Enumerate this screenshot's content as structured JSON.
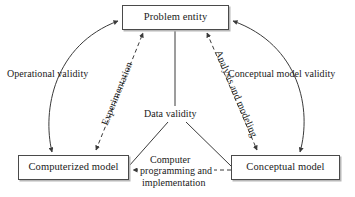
{
  "diagram": {
    "background_color": "#ffffff",
    "line_color": "#3a3a3a",
    "text_color": "#1a1a1a",
    "box_border_color": "#4a4a4a",
    "box_shadow_color": "#b8b8b8",
    "nodes": [
      {
        "id": "problem-entity",
        "label": "Problem entity"
      },
      {
        "id": "computerized-model",
        "label": "Computerized model"
      },
      {
        "id": "conceptual-model",
        "label": "Conceptual model"
      }
    ],
    "edge_labels": [
      {
        "id": "operational-validity",
        "label": "Operational validity"
      },
      {
        "id": "conceptual-model-validity",
        "label": "Conceptual model validity"
      },
      {
        "id": "experimentation",
        "label": "Experimentation"
      },
      {
        "id": "analysis-and-modeling",
        "label": "Analysis and modeling"
      },
      {
        "id": "data-validity",
        "label": "Data validity"
      },
      {
        "id": "computer-programming-line1",
        "label": "Computer"
      },
      {
        "id": "computer-programming-line2",
        "label": "programming and"
      },
      {
        "id": "computer-programming-line3",
        "label": "implementation"
      }
    ]
  }
}
